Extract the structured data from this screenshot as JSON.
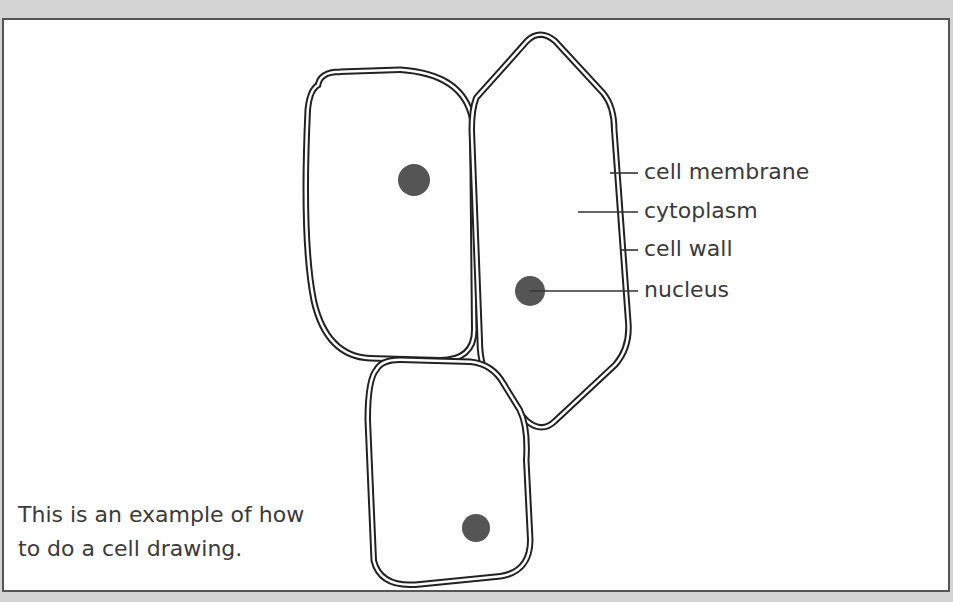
{
  "diagram": {
    "labels": [
      {
        "id": "cell-membrane",
        "text": "cell membrane"
      },
      {
        "id": "cytoplasm",
        "text": "cytoplasm"
      },
      {
        "id": "cell-wall",
        "text": "cell wall"
      },
      {
        "id": "nucleus",
        "text": "nucleus"
      }
    ],
    "caption": {
      "line1": "This is an example of how",
      "line2": "to do a cell drawing."
    },
    "cells": [
      {
        "id": "top-left-cell",
        "has_nucleus": true
      },
      {
        "id": "right-hexagonal-cell",
        "has_nucleus": true
      },
      {
        "id": "bottom-cell",
        "has_nucleus": true
      }
    ],
    "colors": {
      "outline": "#222222",
      "nucleus": "#555555",
      "text": "#3a3a3a",
      "background_outer": "#d4d4d4",
      "frame_border": "#555555"
    }
  }
}
